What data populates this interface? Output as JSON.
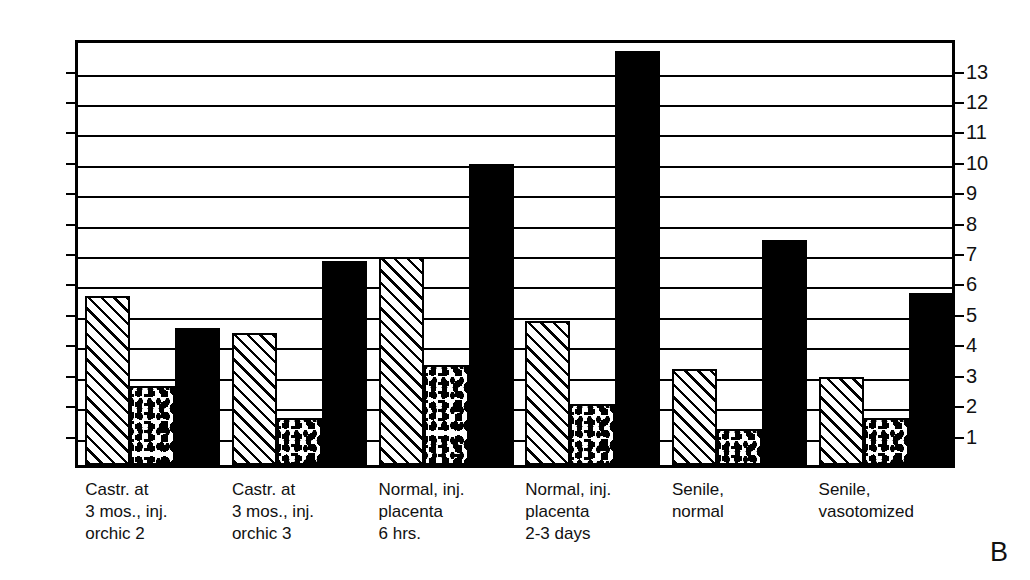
{
  "panel_letter": "B",
  "chart_data": {
    "type": "bar",
    "title": "",
    "subtitle": "",
    "xlabel": "",
    "ylabel": "",
    "ylim": [
      0,
      14.07
    ],
    "grid": true,
    "grid_orientation": "horizontal",
    "legend": "none",
    "y_ticks": [
      1,
      2,
      3,
      4,
      5,
      6,
      7,
      8,
      9,
      10,
      11,
      12,
      13
    ],
    "y_tick_labels": [
      "1",
      "2",
      "3",
      "4",
      "5",
      "6",
      "7",
      "8",
      "9",
      "10",
      "11",
      "12",
      "13"
    ],
    "left_axis_labels": [
      "13",
      "12",
      "11",
      "10",
      "9",
      "8",
      "7",
      "6",
      "5",
      "4",
      "3",
      "2",
      "1"
    ],
    "right_axis_labels": [
      "13",
      "12",
      "11",
      "10",
      "9",
      "8",
      "7",
      "6",
      "5",
      "4",
      "3",
      "2",
      "1"
    ],
    "categories": [
      "Castr. at\n3 mos., inj.\norchic 2",
      "Castr. at\n3 mos., inj.\norchic 3",
      "Normal, inj.\nplacenta\n6 hrs.",
      "Normal, inj.\nplacenta\n2-3 days",
      "Senile,\nnormal",
      "Senile,\nvasotomized"
    ],
    "series": [
      {
        "name": "hatched",
        "pattern": "diagonal-hatch",
        "values": [
          5.55,
          4.35,
          6.85,
          4.75,
          3.15,
          2.9
        ]
      },
      {
        "name": "stippled",
        "pattern": "stipple",
        "values": [
          2.6,
          1.55,
          3.3,
          2.0,
          1.2,
          1.55
        ]
      },
      {
        "name": "solid",
        "pattern": "solid-black",
        "values": [
          4.5,
          6.7,
          9.9,
          13.6,
          7.4,
          5.65
        ]
      }
    ]
  },
  "colors": {
    "ink": "#000000",
    "background": "#ffffff",
    "text": "#111111"
  }
}
